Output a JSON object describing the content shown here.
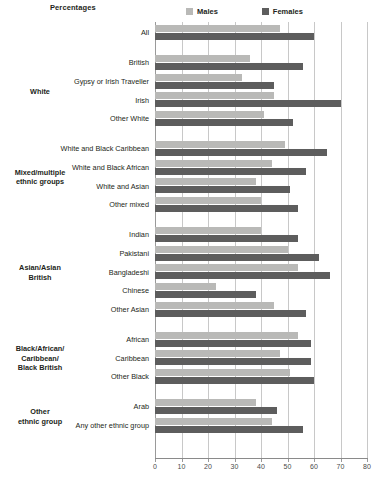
{
  "header": {
    "axis_title": "Percentages"
  },
  "legend": {
    "position": "top-center",
    "items": [
      {
        "label": "Males",
        "color": "#b9b9b7",
        "icon": "square-swatch-icon"
      },
      {
        "label": "Females",
        "color": "#5d5d5d",
        "icon": "square-swatch-icon"
      }
    ]
  },
  "groups": [
    {
      "label": "",
      "label_lines": []
    },
    {
      "label": "White",
      "label_lines": [
        "White"
      ]
    },
    {
      "label": "Mixed/multiple ethnic groups",
      "label_lines": [
        "Mixed/multiple",
        "ethnic groups"
      ]
    },
    {
      "label": "Asian/Asian British",
      "label_lines": [
        "Asian/Asian",
        "British"
      ]
    },
    {
      "label": "Black/African/Caribbean/Black British",
      "label_lines": [
        "Black/African/",
        "Caribbean/",
        "Black British"
      ]
    },
    {
      "label": "Other ethnic group",
      "label_lines": [
        "Other",
        "ethnic group"
      ]
    }
  ],
  "chart_data": {
    "type": "bar",
    "orientation": "horizontal",
    "title": "",
    "xlabel": "Percentages",
    "ylabel": "",
    "xlim": [
      0,
      80
    ],
    "xticks": [
      0,
      10,
      20,
      30,
      40,
      50,
      60,
      70,
      80
    ],
    "grid": true,
    "legend_position": "top-center",
    "categories": [
      "All",
      "British",
      "Gypsy or Irish Traveller",
      "Irish",
      "Other White",
      "White and Black Caribbean",
      "White and Black African",
      "White and Asian",
      "Other mixed",
      "Indian",
      "Pakistani",
      "Bangladeshi",
      "Chinese",
      "Other Asian",
      "African",
      "Caribbean",
      "Other Black",
      "Arab",
      "Any other ethnic group"
    ],
    "series": [
      {
        "name": "Males",
        "color": "#b9b9b7",
        "values": [
          47,
          36,
          33,
          45,
          41,
          49,
          44,
          38,
          40,
          40,
          50,
          54,
          23,
          45,
          54,
          47,
          51,
          38,
          44
        ]
      },
      {
        "name": "Females",
        "color": "#5d5d5d",
        "values": [
          60,
          56,
          45,
          70,
          52,
          65,
          57,
          51,
          54,
          54,
          62,
          66,
          38,
          57,
          59,
          59,
          60,
          46,
          56
        ]
      }
    ]
  }
}
